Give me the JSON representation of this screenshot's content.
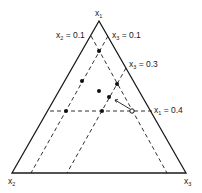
{
  "diagram": {
    "type": "ternary-simplex",
    "vertices": {
      "top": {
        "label": "x",
        "sub": "1"
      },
      "bottom_left": {
        "label": "x",
        "sub": "2"
      },
      "bottom_right": {
        "label": "x",
        "sub": "3"
      }
    },
    "constraint_lines": [
      {
        "var": "x",
        "sub": "2",
        "eq": " = 0.1",
        "style": "dashed"
      },
      {
        "var": "x",
        "sub": "3",
        "eq": " = 0.1",
        "style": "dashed"
      },
      {
        "var": "x",
        "sub": "3",
        "eq": " = 0.3",
        "style": "dashed"
      },
      {
        "var": "x",
        "sub": "1",
        "eq": " = 0.4",
        "style": "dashed"
      }
    ],
    "points": {
      "filled_count": 8,
      "open_count": 1
    },
    "arrow": "from open point on x1 = 0.4 toward interior point",
    "colors": {
      "line": "#1a1a1a",
      "background": "#ffffff"
    }
  }
}
